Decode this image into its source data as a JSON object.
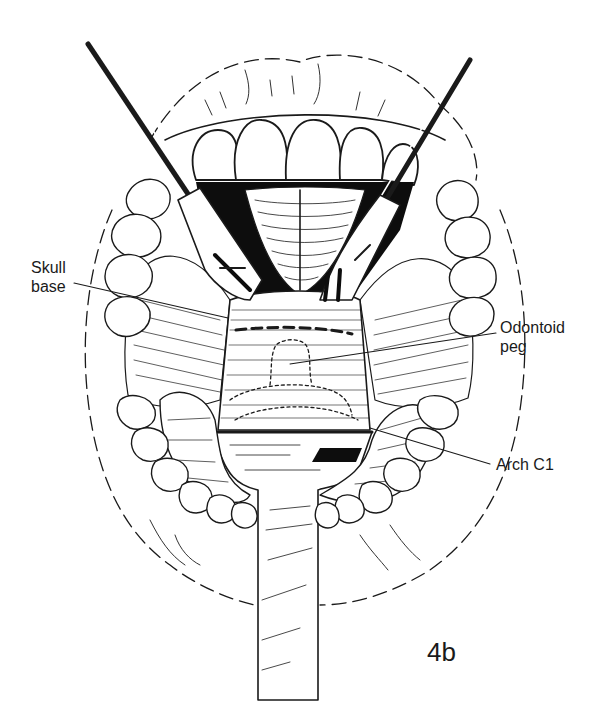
{
  "figure": {
    "id_label": "4b",
    "colors": {
      "ink": "#1a1a1a",
      "paper": "#ffffff",
      "shadow": "#0d0d0d"
    }
  },
  "labels": {
    "skull_base": "Skull\nbase",
    "odontoid_peg": "Odontoid\npeg",
    "arch_c1": "Arch C1"
  },
  "leaders": {
    "skull_base": {
      "from": [
        74,
        283
      ],
      "to": [
        228,
        318
      ]
    },
    "odontoid_peg": {
      "from": [
        496,
        333
      ],
      "to": [
        290,
        364
      ]
    },
    "arch_c1": {
      "from": [
        490,
        464
      ],
      "to": [
        370,
        428
      ]
    }
  }
}
